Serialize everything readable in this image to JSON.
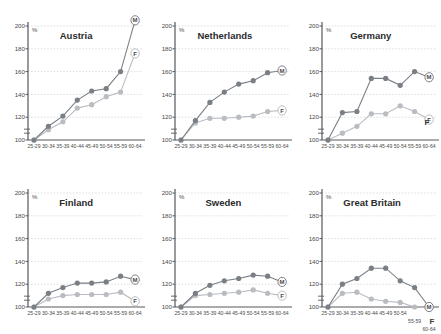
{
  "figure": {
    "unit_label": "%",
    "series_names": {
      "male": "M",
      "female": "F"
    },
    "colors": {
      "male": "#7a7f86",
      "female": "#b9bcc0",
      "axis": "#55585c",
      "grid": "#cfd2d6",
      "text": "#3b3b3b"
    }
  },
  "chart_data": [
    {
      "type": "line",
      "title": "Austria",
      "xlabel": "",
      "ylabel": "%",
      "ylim": [
        100,
        200
      ],
      "yticks": [
        100,
        120,
        140,
        160,
        180,
        200
      ],
      "grid": true,
      "legend": "endpoint-markers",
      "categories": [
        "25-29",
        "30-34",
        "35-39",
        "40-44",
        "45-49",
        "50-54",
        "55-59",
        "60-64"
      ],
      "series": [
        {
          "name": "M",
          "values": [
            100,
            112,
            121,
            135,
            143,
            145,
            160,
            205
          ]
        },
        {
          "name": "F",
          "values": [
            100,
            109,
            116,
            128,
            131,
            138,
            142,
            176
          ]
        }
      ]
    },
    {
      "type": "line",
      "title": "Netherlands",
      "xlabel": "",
      "ylabel": "%",
      "ylim": [
        100,
        200
      ],
      "yticks": [
        100,
        120,
        140,
        160,
        180,
        200
      ],
      "grid": true,
      "legend": "endpoint-markers",
      "categories": [
        "25-29",
        "30-34",
        "35-39",
        "40-44",
        "45-49",
        "50-54",
        "55-59",
        "60-64"
      ],
      "series": [
        {
          "name": "M",
          "values": [
            100,
            117,
            133,
            142,
            149,
            152,
            159,
            161
          ]
        },
        {
          "name": "F",
          "values": [
            100,
            115,
            119,
            119,
            120,
            121,
            125,
            126
          ]
        }
      ]
    },
    {
      "type": "line",
      "title": "Germany",
      "xlabel": "",
      "ylabel": "%",
      "ylim": [
        100,
        200
      ],
      "yticks": [
        100,
        120,
        140,
        160,
        180,
        200
      ],
      "grid": true,
      "legend": "endpoint-markers",
      "categories": [
        "25-29",
        "30-34",
        "35-39",
        "40-44",
        "45-49",
        "50-54",
        "55-59",
        "60-64"
      ],
      "series": [
        {
          "name": "M",
          "values": [
            100,
            124,
            125,
            154,
            154,
            148,
            160,
            155
          ]
        },
        {
          "name": "F",
          "values": [
            100,
            106,
            112,
            123,
            123,
            130,
            125,
            118
          ]
        }
      ]
    },
    {
      "type": "line",
      "title": "Finland",
      "xlabel": "",
      "ylabel": "%",
      "ylim": [
        100,
        200
      ],
      "yticks": [
        100,
        120,
        140,
        160,
        180,
        200
      ],
      "grid": true,
      "legend": "endpoint-markers",
      "categories": [
        "25-29",
        "30-34",
        "35-39",
        "40-44",
        "45-49",
        "50-54",
        "55-59",
        "60-64"
      ],
      "series": [
        {
          "name": "M",
          "values": [
            100,
            112,
            117,
            121,
            121,
            122,
            127,
            124
          ]
        },
        {
          "name": "F",
          "values": [
            100,
            107,
            110,
            111,
            111,
            111,
            113,
            105
          ]
        }
      ]
    },
    {
      "type": "line",
      "title": "Sweden",
      "xlabel": "",
      "ylabel": "%",
      "ylim": [
        100,
        200
      ],
      "yticks": [
        100,
        120,
        140,
        160,
        180,
        200
      ],
      "grid": true,
      "legend": "endpoint-markers",
      "categories": [
        "25-29",
        "30-34",
        "35-39",
        "40-44",
        "45-49",
        "50-54",
        "55-59",
        "60-64"
      ],
      "series": [
        {
          "name": "M",
          "values": [
            100,
            112,
            119,
            123,
            125,
            128,
            127,
            122
          ]
        },
        {
          "name": "F",
          "values": [
            100,
            110,
            111,
            112,
            113,
            115,
            112,
            110
          ]
        }
      ]
    },
    {
      "type": "line",
      "title": "Great Britain",
      "xlabel": "",
      "ylabel": "%",
      "ylim": [
        100,
        200
      ],
      "yticks": [
        100,
        120,
        140,
        160,
        180,
        200
      ],
      "grid": true,
      "legend": "endpoint-markers",
      "categories": [
        "25-29",
        "30-34",
        "35-39",
        "40-44",
        "45-49",
        "50-54",
        "55-59",
        "60-64"
      ],
      "series": [
        {
          "name": "M",
          "values": [
            100,
            120,
            125,
            134,
            134,
            123,
            117,
            100
          ]
        },
        {
          "name": "F",
          "values": [
            100,
            112,
            113,
            107,
            105,
            104,
            100,
            100
          ]
        }
      ]
    }
  ]
}
